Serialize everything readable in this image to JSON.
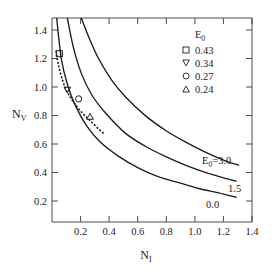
{
  "figure": {
    "title": "",
    "background_color": "#ffffff",
    "line_color": "#1c1c1c",
    "axis_color": "#4a4a4a"
  },
  "axes": {
    "x": {
      "title_base": "N",
      "title_sub": "I",
      "ticks": [
        "0.2",
        "0.4",
        "0.6",
        "0.8",
        "1.0",
        "1.2",
        "1.4"
      ],
      "tick_values": [
        0.2,
        0.4,
        0.6,
        0.8,
        1.0,
        1.2,
        1.4
      ],
      "min": 0.0,
      "max": 1.5
    },
    "y": {
      "title_base": "N",
      "title_sub": "V",
      "ticks": [
        "0.2",
        "0.4",
        "0.6",
        "0.8",
        "1.0",
        "1.2",
        "1.4"
      ],
      "tick_values": [
        0.2,
        0.4,
        0.6,
        0.8,
        1.0,
        1.2,
        1.4
      ],
      "min": 0.1,
      "max": 1.5
    }
  },
  "legend": {
    "title_base": "E",
    "title_sub": "0",
    "entries": [
      {
        "marker": "square",
        "label": "0.43"
      },
      {
        "marker": "triangle-down",
        "label": "0.34"
      },
      {
        "marker": "circle",
        "label": "0.27"
      },
      {
        "marker": "triangle-up",
        "label": "0.24"
      }
    ]
  },
  "curve_labels": [
    {
      "id": "label-e0-3",
      "base": "E",
      "sub": "0",
      "eq": "=3.0"
    },
    {
      "id": "label-1-5",
      "text": "1.5"
    },
    {
      "id": "label-0-0",
      "text": "0.0"
    }
  ],
  "chart_data": {
    "type": "line",
    "title": "",
    "xlabel": "N_I",
    "ylabel": "N_V",
    "xlim": [
      0.0,
      1.5
    ],
    "ylim": [
      0.1,
      1.5
    ],
    "grid": false,
    "legend_position": "top-right",
    "legend_title": "E_0",
    "series": [
      {
        "name": "E_0 = 3.0",
        "style": "solid",
        "label_on_plot": "E_0=3.0",
        "x": [
          0.22,
          0.28,
          0.35,
          0.45,
          0.55,
          0.7,
          0.85,
          1.0,
          1.15,
          1.3,
          1.4
        ],
        "y": [
          1.5,
          1.36,
          1.22,
          1.07,
          0.96,
          0.83,
          0.73,
          0.65,
          0.58,
          0.52,
          0.49
        ]
      },
      {
        "name": "E_0 = 1.5",
        "style": "solid",
        "label_on_plot": "1.5",
        "x": [
          0.115,
          0.16,
          0.22,
          0.3,
          0.4,
          0.55,
          0.7,
          0.85,
          1.0,
          1.15,
          1.3,
          1.38
        ],
        "y": [
          1.5,
          1.3,
          1.12,
          0.97,
          0.85,
          0.71,
          0.62,
          0.55,
          0.49,
          0.44,
          0.4,
          0.38
        ]
      },
      {
        "name": "E_0 = 0.0",
        "style": "solid",
        "label_on_plot": "0.0",
        "x": [
          0.035,
          0.07,
          0.12,
          0.18,
          0.26,
          0.36,
          0.5,
          0.65,
          0.8,
          0.95,
          1.1,
          1.25,
          1.38
        ],
        "y": [
          1.5,
          1.22,
          1.03,
          0.89,
          0.76,
          0.65,
          0.55,
          0.47,
          0.41,
          0.37,
          0.33,
          0.3,
          0.27
        ]
      },
      {
        "name": "experimental-fit",
        "style": "dotted",
        "x": [
          0.03,
          0.05,
          0.08,
          0.11,
          0.145,
          0.185,
          0.23,
          0.275,
          0.32,
          0.365,
          0.4
        ],
        "y": [
          1.27,
          1.17,
          1.07,
          1.0,
          0.945,
          0.895,
          0.845,
          0.805,
          0.765,
          0.725,
          0.7
        ]
      }
    ],
    "points": [
      {
        "marker": "square",
        "label": "0.43",
        "x": 0.055,
        "y": 1.255
      },
      {
        "marker": "triangle-down",
        "label": "0.34",
        "x": 0.115,
        "y": 1.01
      },
      {
        "marker": "circle",
        "label": "0.27",
        "x": 0.2,
        "y": 0.945
      },
      {
        "marker": "triangle-up",
        "label": "0.24",
        "x": 0.285,
        "y": 0.82
      }
    ]
  }
}
